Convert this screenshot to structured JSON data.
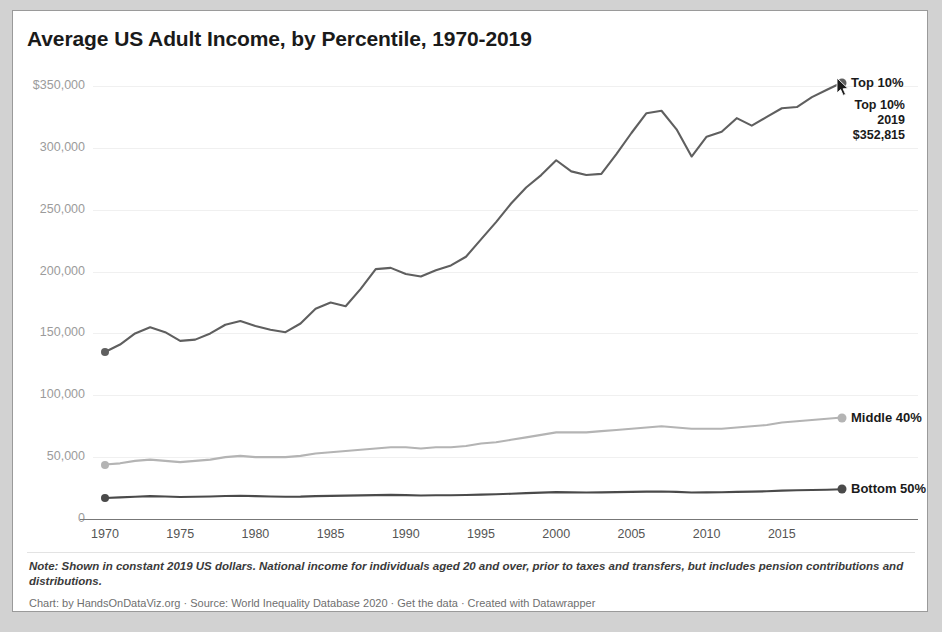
{
  "card": {
    "title": "Average US Adult Income, by Percentile, 1970-2019",
    "note": "Note: Shown in constant 2019 US dollars. National income for individuals aged 20 and over, prior to taxes and transfers, but includes pension contributions and distributions.",
    "credit": "Chart: by HandsOnDataViz.org · Source: World Inequality Database 2020 · Get the data · Created with Datawrapper"
  },
  "tooltip": {
    "series": "Top 10%",
    "year": "2019",
    "value": "$352,815"
  },
  "cursor": {
    "icon": "mouse-pointer-icon"
  },
  "labels": {
    "top10": "Top 10%",
    "middle40": "Middle 40%",
    "bottom50": "Bottom 50%"
  },
  "colors": {
    "top10": "#5f5f5f",
    "middle40": "#b4b4b4",
    "bottom50": "#4a4a4a",
    "grid": "#f0f0f0",
    "axis": "#777777",
    "ytick": "#9b9b9b",
    "xtick": "#555555",
    "title": "#1a1a1a",
    "card_bg": "#ffffff",
    "page_bg": "#d2d2d2"
  },
  "chart_data": {
    "type": "line",
    "title": "Average US Adult Income, by Percentile, 1970-2019",
    "xlabel": "",
    "ylabel": "",
    "xlim": [
      1970,
      2019
    ],
    "ylim": [
      0,
      350000
    ],
    "grid": true,
    "legend": "inline-right-labels",
    "ytick_labels": [
      "$350,000",
      "300,000",
      "250,000",
      "200,000",
      "150,000",
      "100,000",
      "50,000",
      "0"
    ],
    "ytick_values": [
      350000,
      300000,
      250000,
      200000,
      150000,
      100000,
      50000,
      0
    ],
    "xtick_labels": [
      "1970",
      "1975",
      "1980",
      "1985",
      "1990",
      "1995",
      "2000",
      "2005",
      "2010",
      "2015"
    ],
    "xtick_values": [
      1970,
      1975,
      1980,
      1985,
      1990,
      1995,
      2000,
      2005,
      2010,
      2015
    ],
    "x": [
      1970,
      1971,
      1972,
      1973,
      1974,
      1975,
      1976,
      1977,
      1978,
      1979,
      1980,
      1981,
      1982,
      1983,
      1984,
      1985,
      1986,
      1987,
      1988,
      1989,
      1990,
      1991,
      1992,
      1993,
      1994,
      1995,
      1996,
      1997,
      1998,
      1999,
      2000,
      2001,
      2002,
      2003,
      2004,
      2005,
      2006,
      2007,
      2008,
      2009,
      2010,
      2011,
      2012,
      2013,
      2014,
      2015,
      2016,
      2017,
      2018,
      2019
    ],
    "series": [
      {
        "name": "Top 10%",
        "color": "#5f5f5f",
        "end_label": "Top 10%",
        "values": [
          135000,
          141000,
          150000,
          155000,
          151000,
          144000,
          145000,
          150000,
          157000,
          160000,
          156000,
          153000,
          151000,
          158000,
          170000,
          175000,
          172000,
          186000,
          202000,
          203000,
          198000,
          196000,
          201000,
          205000,
          212000,
          226000,
          240000,
          255000,
          268000,
          278000,
          290000,
          281000,
          278000,
          279000,
          295000,
          312000,
          328000,
          330000,
          315000,
          293000,
          309000,
          313000,
          324000,
          318000,
          325000,
          332000,
          333000,
          341000,
          347000,
          352815
        ]
      },
      {
        "name": "Middle 40%",
        "color": "#b4b4b4",
        "end_label": "Middle 40%",
        "values": [
          44000,
          45000,
          47000,
          48000,
          47000,
          46000,
          47000,
          48000,
          50000,
          51000,
          50000,
          50000,
          50000,
          51000,
          53000,
          54000,
          55000,
          56000,
          57000,
          58000,
          58000,
          57000,
          58000,
          58000,
          59000,
          61000,
          62000,
          64000,
          66000,
          68000,
          70000,
          70000,
          70000,
          71000,
          72000,
          73000,
          74000,
          75000,
          74000,
          73000,
          73000,
          73000,
          74000,
          75000,
          76000,
          78000,
          79000,
          80000,
          81000,
          82000
        ]
      },
      {
        "name": "Bottom 50%",
        "color": "#4a4a4a",
        "end_label": "Bottom 50%",
        "values": [
          17000,
          17500,
          18000,
          18500,
          18200,
          17800,
          18000,
          18200,
          18600,
          18800,
          18500,
          18200,
          18000,
          18100,
          18500,
          18700,
          18900,
          19100,
          19300,
          19500,
          19300,
          19000,
          19200,
          19200,
          19400,
          19700,
          20000,
          20400,
          20900,
          21300,
          21700,
          21500,
          21400,
          21500,
          21700,
          21900,
          22100,
          22200,
          21900,
          21400,
          21500,
          21600,
          21900,
          22100,
          22400,
          22900,
          23200,
          23400,
          23700,
          24000
        ]
      }
    ]
  }
}
